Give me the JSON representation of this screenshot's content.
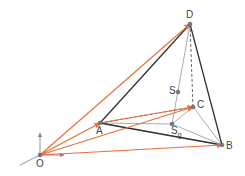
{
  "diagram": {
    "type": "tetrahedron-vectors",
    "colors": {
      "vector": "#e8703a",
      "edge": "#333333",
      "hidden_edge": "#555555",
      "median": "#888888",
      "axis": "#8a8a8a",
      "point": "#6a7a90"
    },
    "points": [
      {
        "id": "O",
        "label": "O",
        "x": 40,
        "y": 155,
        "label_dx": -4,
        "label_dy": 4
      },
      {
        "id": "A",
        "label": "A",
        "x": 100,
        "y": 123,
        "label_dx": -4,
        "label_dy": 3
      },
      {
        "id": "B",
        "label": "B",
        "x": 222,
        "y": 145,
        "label_dx": 4,
        "label_dy": -4
      },
      {
        "id": "C",
        "label": "C",
        "x": 193,
        "y": 107,
        "label_dx": 4,
        "label_dy": -7
      },
      {
        "id": "D",
        "label": "D",
        "x": 190,
        "y": 24,
        "label_dx": -4,
        "label_dy": -14
      },
      {
        "id": "S",
        "label": "S",
        "x": 178,
        "y": 92,
        "label_dx": -9,
        "label_dy": -6
      },
      {
        "id": "Sg",
        "label": "S",
        "sub": "g",
        "x": 172,
        "y": 124,
        "label_dx": -1,
        "label_dy": 2
      }
    ],
    "vectors": [
      [
        "O",
        "A"
      ],
      [
        "O",
        "B"
      ],
      [
        "O",
        "C"
      ],
      [
        "O",
        "D"
      ],
      [
        "A",
        "C"
      ]
    ],
    "solid_edges": [
      [
        "A",
        "D"
      ],
      [
        "D",
        "B"
      ],
      [
        "A",
        "B"
      ]
    ],
    "dashed_edges": [
      [
        "A",
        "C"
      ],
      [
        "D",
        "C"
      ]
    ],
    "thin_lines": [
      [
        "D",
        "Sg"
      ],
      [
        "C",
        "B"
      ],
      [
        "A",
        "B"
      ],
      [
        "A",
        "Sg"
      ],
      [
        "Sg",
        "B"
      ],
      [
        "C",
        "Sg"
      ]
    ],
    "axes": {
      "origin": "O",
      "up": [
        0,
        -22
      ],
      "right": [
        24,
        0
      ],
      "back": [
        -20,
        10
      ]
    }
  }
}
